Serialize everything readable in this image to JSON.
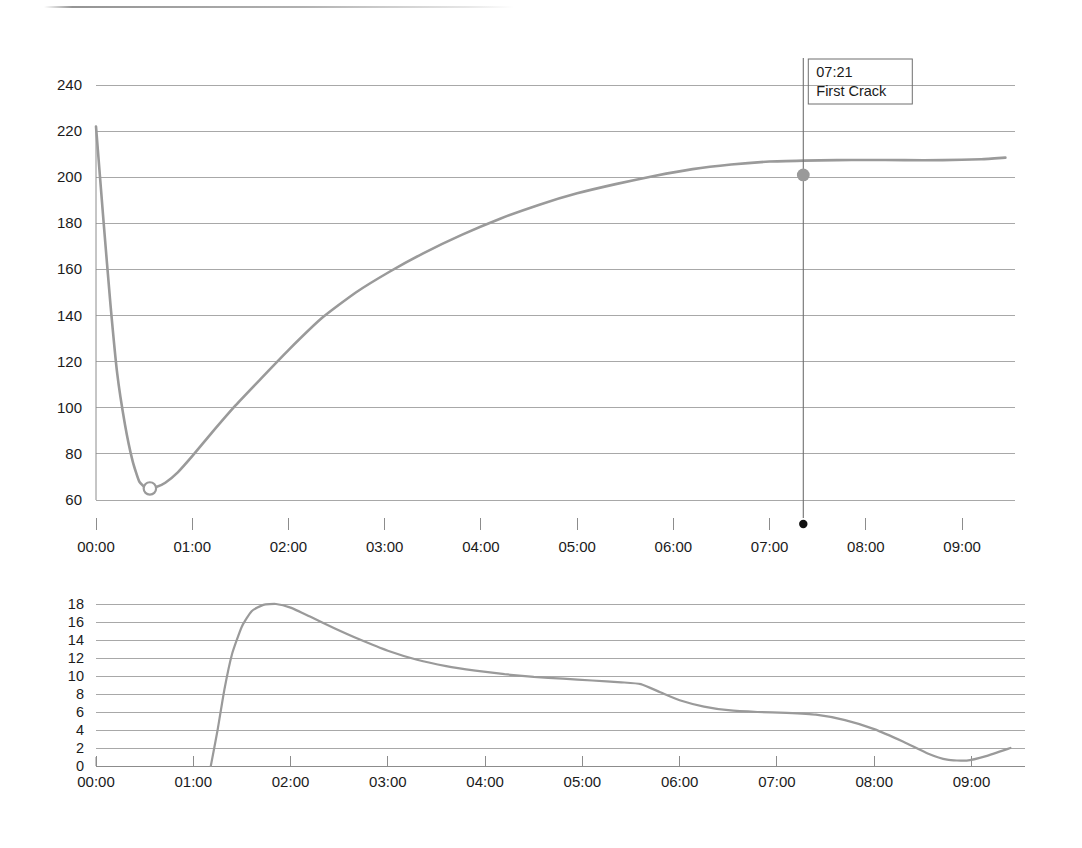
{
  "document": {
    "kind": "roast-profile-chart-scan",
    "scan_artifact_visible": true
  },
  "colors": {
    "curve": "#9a9a9a",
    "gridline": "#a8a8a8",
    "axis": "#8c8c8c",
    "text": "#1b1b1b",
    "marker_fill": "#9a9a9a",
    "annotation_dot": "#111111",
    "background": "#ffffff"
  },
  "annotations": {
    "first_crack": {
      "time": "07:21",
      "label": "First Crack",
      "x_time_hours": 7.35,
      "y_value": 201
    }
  },
  "chart_data": [
    {
      "id": "bean-temperature",
      "type": "line",
      "title": "",
      "xlabel": "",
      "ylabel": "",
      "xlim": [
        0,
        9.55
      ],
      "ylim": [
        60,
        240
      ],
      "grid": true,
      "legend": "none",
      "x_ticks": [
        "00:00",
        "01:00",
        "02:00",
        "03:00",
        "04:00",
        "05:00",
        "06:00",
        "07:00",
        "08:00",
        "09:00"
      ],
      "x_tick_values": [
        0,
        1,
        2,
        3,
        4,
        5,
        6,
        7,
        8,
        9
      ],
      "y_ticks": [
        60,
        80,
        100,
        120,
        140,
        160,
        180,
        200,
        220,
        240
      ],
      "series": [
        {
          "name": "Bean Temperature",
          "x": [
            0.0,
            0.08,
            0.15,
            0.22,
            0.3,
            0.38,
            0.45,
            0.53,
            0.62,
            0.72,
            0.85,
            1.0,
            1.2,
            1.45,
            1.7,
            2.0,
            2.35,
            2.7,
            3.05,
            3.4,
            3.8,
            4.2,
            4.6,
            5.0,
            5.4,
            5.8,
            6.2,
            6.6,
            7.0,
            7.35,
            7.7,
            8.0,
            8.4,
            8.8,
            9.2,
            9.45
          ],
          "values": [
            222,
            180,
            145,
            115,
            93,
            77,
            68,
            65,
            65.5,
            67.5,
            72,
            79,
            89,
            101,
            112,
            125,
            139,
            150,
            159,
            167,
            175,
            182,
            188,
            193,
            197,
            200.5,
            203.5,
            205.5,
            206.8,
            207.2,
            207.4,
            207.5,
            207.4,
            207.4,
            207.8,
            208.5
          ]
        }
      ],
      "markers": [
        {
          "name": "turning-point",
          "style": "open-circle",
          "x": 0.56,
          "y": 65
        },
        {
          "name": "first-crack-point",
          "style": "filled-circle",
          "x": 7.35,
          "y": 201
        }
      ],
      "vertical_line": {
        "x": 7.35,
        "label_time": "07:21",
        "label_text": "First Crack"
      }
    },
    {
      "id": "rate-of-rise",
      "type": "line",
      "title": "",
      "xlabel": "",
      "ylabel": "",
      "xlim": [
        0,
        9.55
      ],
      "ylim": [
        0,
        19
      ],
      "grid": true,
      "legend": "none",
      "x_ticks": [
        "00:00",
        "01:00",
        "02:00",
        "03:00",
        "04:00",
        "05:00",
        "06:00",
        "07:00",
        "08:00",
        "09:00"
      ],
      "x_tick_values": [
        0,
        1,
        2,
        3,
        4,
        5,
        6,
        7,
        8,
        9
      ],
      "y_ticks": [
        0,
        2,
        4,
        6,
        8,
        10,
        12,
        14,
        16,
        18
      ],
      "series": [
        {
          "name": "Rate of Rise",
          "x": [
            1.18,
            1.25,
            1.32,
            1.4,
            1.5,
            1.6,
            1.72,
            1.85,
            2.0,
            2.2,
            2.45,
            2.7,
            3.0,
            3.3,
            3.6,
            3.9,
            4.2,
            4.5,
            4.8,
            5.1,
            5.4,
            5.6,
            5.8,
            6.0,
            6.25,
            6.5,
            6.8,
            7.1,
            7.4,
            7.7,
            8.0,
            8.3,
            8.55,
            8.75,
            8.95,
            9.15,
            9.4
          ],
          "values": [
            0.0,
            4.0,
            8.5,
            12.5,
            15.5,
            17.2,
            17.9,
            18.0,
            17.6,
            16.6,
            15.3,
            14.1,
            12.8,
            11.8,
            11.1,
            10.6,
            10.2,
            9.9,
            9.7,
            9.5,
            9.3,
            9.1,
            8.2,
            7.3,
            6.6,
            6.2,
            6.0,
            5.9,
            5.7,
            5.1,
            4.1,
            2.7,
            1.4,
            0.7,
            0.6,
            1.1,
            2.0
          ]
        }
      ]
    }
  ]
}
